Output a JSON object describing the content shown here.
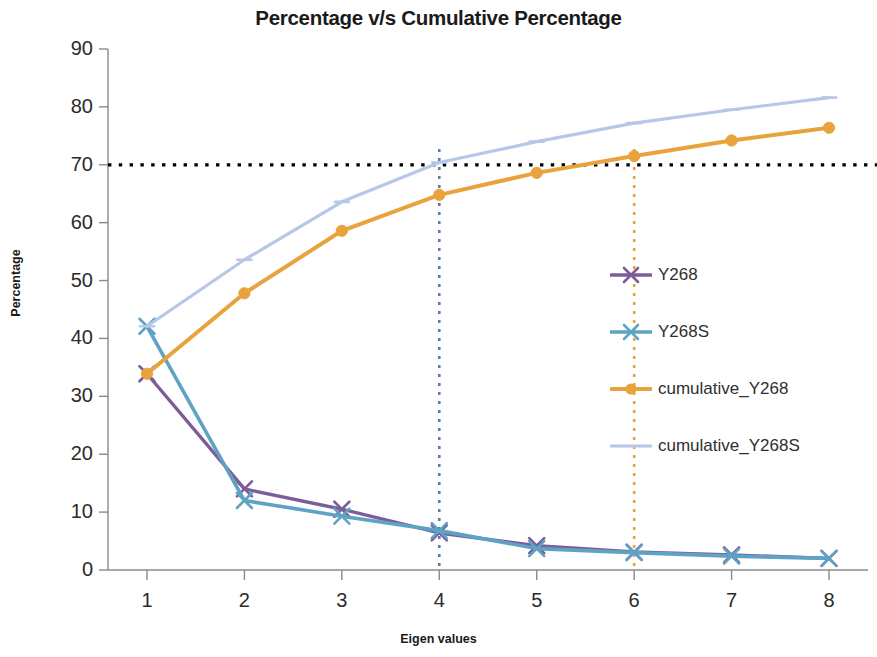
{
  "chart_data": {
    "type": "line",
    "title": "Percentage v/s Cumulative Percentage",
    "xlabel": "Eigen values",
    "ylabel": "Percentage",
    "x": [
      1,
      2,
      3,
      4,
      5,
      6,
      7,
      8
    ],
    "xticklabels": [
      "1",
      "2",
      "3",
      "4",
      "5",
      "6",
      "7",
      "8"
    ],
    "yticklabels": [
      "0",
      "10",
      "20",
      "30",
      "40",
      "50",
      "60",
      "70",
      "80",
      "90"
    ],
    "yticks": [
      0,
      10,
      20,
      30,
      40,
      50,
      60,
      70,
      80,
      90
    ],
    "xlim": [
      0.6,
      8.4
    ],
    "ylim": [
      0,
      90
    ],
    "grid": false,
    "legend_position": "center-right",
    "series": [
      {
        "name": "Y268",
        "color": "#7D5C9A",
        "marker": "x",
        "values": [
          33.9,
          14.0,
          10.5,
          6.4,
          4.2,
          3.1,
          2.6,
          2.0
        ]
      },
      {
        "name": "Y268S",
        "color": "#5FA3C4",
        "marker": "x",
        "values": [
          42.1,
          12.0,
          9.3,
          6.8,
          3.7,
          3.0,
          2.4,
          2.0
        ]
      },
      {
        "name": "cumulative_Y268",
        "color": "#E8A33D",
        "marker": "circle",
        "values": [
          33.9,
          47.8,
          58.6,
          64.8,
          68.6,
          71.5,
          74.2,
          76.4
        ]
      },
      {
        "name": "cumulative_Y268S",
        "color": "#B6C7E8",
        "marker": "dash",
        "values": [
          42.1,
          53.6,
          63.6,
          70.4,
          74.0,
          77.2,
          79.5,
          81.6
        ]
      }
    ],
    "annotations": [
      {
        "name": "threshold-line-70",
        "type": "hline",
        "value": 70,
        "color": "#000000",
        "style": "dotted"
      },
      {
        "name": "marker-line-x4",
        "type": "vline",
        "value": 4,
        "color": "#5E7AA8",
        "style": "dotted"
      },
      {
        "name": "marker-line-x6",
        "type": "vline",
        "value": 6,
        "color": "#E8A33D",
        "style": "dotted"
      }
    ]
  },
  "legend": {
    "items": [
      {
        "label": "Y268"
      },
      {
        "label": "Y268S"
      },
      {
        "label": "cumulative_Y268"
      },
      {
        "label": "cumulative_Y268S"
      }
    ]
  }
}
